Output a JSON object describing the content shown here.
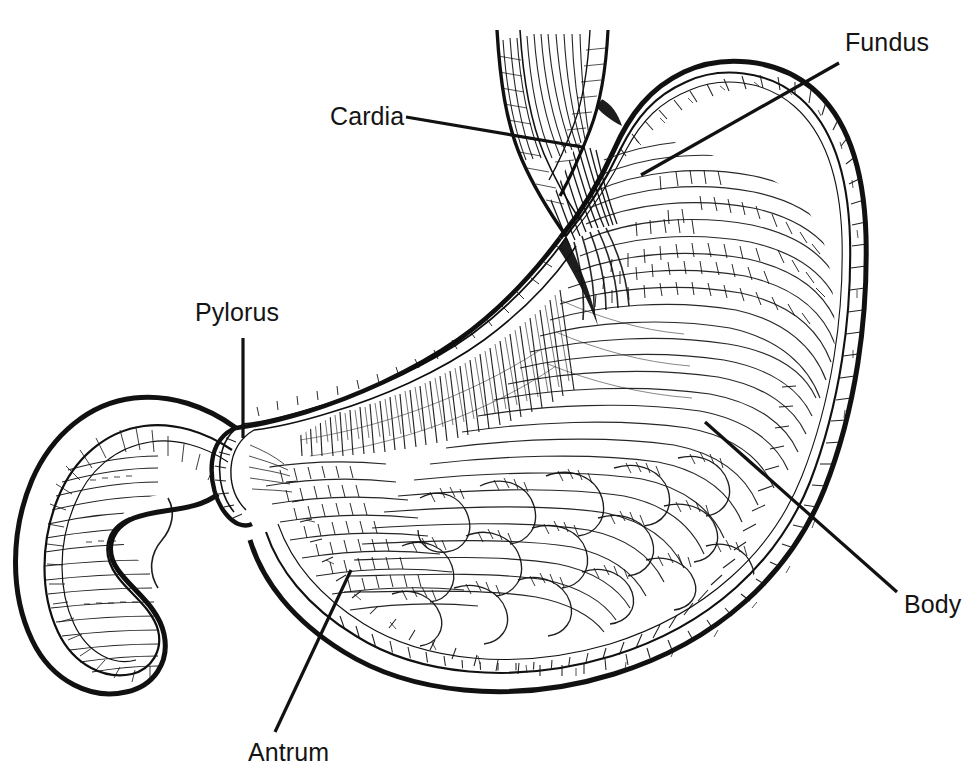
{
  "figure": {
    "kind": "anatomical-line-illustration",
    "background_color": "#ffffff",
    "ink_color": "#111111",
    "width": 976,
    "height": 782
  },
  "labels": {
    "fundus": "Fundus",
    "cardia": "Cardia",
    "pylorus": "Pylorus",
    "body": "Body",
    "antrum": "Antrum"
  },
  "leaders": {
    "fundus": "leader-line-fundus",
    "cardia": "leader-line-cardia",
    "pylorus": "leader-line-pylorus",
    "body": "leader-line-body",
    "antrum": "leader-line-antrum"
  },
  "structures": {
    "esophagus": "esophagus",
    "gastric_wall": "stomach-wall",
    "rugae": "gastric-rugae-mucosal-folds",
    "muscularis": "muscularis-hatching",
    "greater_curvature": "greater-curvature",
    "lesser_curvature": "lesser-curvature",
    "pyloric_sphincter": "pyloric-sphincter",
    "duodenum": "duodenum-c-loop"
  }
}
